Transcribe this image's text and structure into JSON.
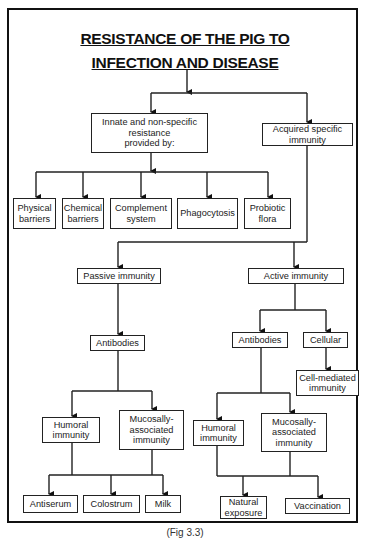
{
  "diagram": {
    "title_line1": "RESISTANCE OF THE PIG TO",
    "title_line2": "INFECTION AND DISEASE",
    "caption": "(Fig 3.3)",
    "nodes": {
      "innate": "Innate and non-specific\nresistance\nprovided by:",
      "acquired": "Acquired specific\nimmunity",
      "physical": "Physical\nbarriers",
      "chemical": "Chemical\nbarriers",
      "complement": "Complement\nsystem",
      "phagocytosis": "Phagocytosis",
      "probiotic": "Probiotic\nflora",
      "passive": "Passive immunity",
      "active": "Active immunity",
      "passive_antibodies": "Antibodies",
      "active_antibodies": "Antibodies",
      "cellular": "Cellular",
      "cell_mediated": "Cell-mediated\nimmunity",
      "passive_humoral": "Humoral\nimmunity",
      "passive_mucosal": "Mucosally-\nassociated\nimmunity",
      "active_humoral": "Humoral\nimmunity",
      "active_mucosal": "Mucosally-\nassociated\nimmunity",
      "antiserum": "Antiserum",
      "colostrum": "Colostrum",
      "milk": "Milk",
      "natural_exposure": "Natural\nexposure",
      "vaccination": "Vaccination"
    },
    "edges": [
      [
        "title",
        "innate"
      ],
      [
        "title",
        "acquired"
      ],
      [
        "innate",
        "physical"
      ],
      [
        "innate",
        "chemical"
      ],
      [
        "innate",
        "complement"
      ],
      [
        "innate",
        "phagocytosis"
      ],
      [
        "innate",
        "probiotic"
      ],
      [
        "acquired",
        "passive"
      ],
      [
        "acquired",
        "active"
      ],
      [
        "passive",
        "passive_antibodies"
      ],
      [
        "active",
        "active_antibodies"
      ],
      [
        "active",
        "cellular"
      ],
      [
        "cellular",
        "cell_mediated"
      ],
      [
        "passive_antibodies",
        "passive_humoral"
      ],
      [
        "passive_antibodies",
        "passive_mucosal"
      ],
      [
        "active_antibodies",
        "active_humoral"
      ],
      [
        "active_antibodies",
        "active_mucosal"
      ],
      [
        "passive_humoral",
        "antiserum"
      ],
      [
        "passive_mucosal",
        "colostrum"
      ],
      [
        "passive_mucosal",
        "milk"
      ],
      [
        "active_humoral",
        "natural_exposure"
      ],
      [
        "active_mucosal",
        "natural_exposure"
      ],
      [
        "active_mucosal",
        "vaccination"
      ]
    ]
  }
}
